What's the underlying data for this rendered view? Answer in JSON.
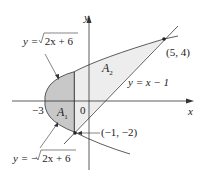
{
  "diagram": {
    "type": "region-between-curves",
    "curves": [
      {
        "id": "upper",
        "label": "y = √(2x + 6)",
        "label_prefix": "y = ",
        "radicand": "2x + 6"
      },
      {
        "id": "lower",
        "label": "y = −√(2x + 6)",
        "label_prefix": "y = −",
        "radicand": "2x + 6"
      },
      {
        "id": "line",
        "label": "y = x − 1"
      }
    ],
    "axes": {
      "x_label": "x",
      "y_label": "y",
      "origin_label": "0",
      "x_tick_label": "−3"
    },
    "points": [
      {
        "label": "(5, 4)",
        "x": 5,
        "y": 4
      },
      {
        "label": "(−1, −2)",
        "x": -1,
        "y": -2
      }
    ],
    "regions": [
      {
        "label_main": "A",
        "label_sub": "1",
        "shaded": true
      },
      {
        "label_main": "A",
        "label_sub": "2",
        "shaded": true
      }
    ],
    "colors": {
      "shade_A1": "#c8c8c8",
      "shade_A2": "#ededed",
      "stroke": "#333333"
    }
  }
}
